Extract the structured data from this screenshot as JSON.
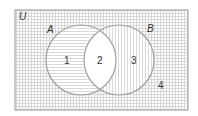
{
  "diagram": {
    "type": "venn",
    "universe_label": "U",
    "sets": [
      {
        "label": "A",
        "pattern": "horizontal-lines"
      },
      {
        "label": "B",
        "pattern": "vertical-lines"
      }
    ],
    "regions": [
      {
        "label": "1",
        "description": "A only",
        "pattern": "horizontal-lines"
      },
      {
        "label": "2",
        "description": "A and B",
        "pattern": "none"
      },
      {
        "label": "3",
        "description": "B only",
        "pattern": "vertical-lines"
      },
      {
        "label": "4",
        "description": "outside A and B",
        "pattern": "grid"
      }
    ],
    "colors": {
      "outline": "#9a9a9a",
      "hatch": "#c8c8c8",
      "text": "#333333",
      "background": "#ffffff"
    }
  }
}
